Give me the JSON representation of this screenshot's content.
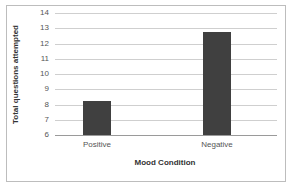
{
  "chart_data": {
    "type": "bar",
    "title": "",
    "categories": [
      "Positive",
      "Negative"
    ],
    "values": [
      8.2,
      12.75
    ],
    "xlabel": "Mood Condition",
    "ylabel": "Total questions attempted",
    "ylim": [
      6,
      14
    ],
    "yticks": [
      "6",
      "7",
      "8",
      "9",
      "10",
      "11",
      "12",
      "13",
      "14"
    ],
    "grid": true,
    "legend": null,
    "bar_color": "#404040"
  }
}
